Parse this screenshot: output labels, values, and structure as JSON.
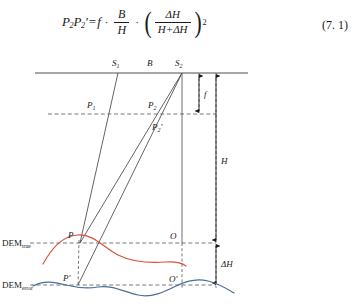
{
  "equation": {
    "lhs_p": "P",
    "lhs_sub1": "2",
    "lhs_p_prime": "P",
    "lhs_sub2": "2",
    "prime_mark": "′",
    "equals": "=",
    "f": "f",
    "dot": "·",
    "frac1_num": "B",
    "frac1_den": "H",
    "frac2_num": "ΔH",
    "frac2_den": "H+ΔH",
    "exponent": "2",
    "number": "(7. 1)",
    "full_text": "P2P2′ = f · B/H · (ΔH/(H+ΔH))²"
  },
  "diagram": {
    "labels": {
      "s1": "S",
      "s1_sub": "1",
      "baseline": "B",
      "s2": "S",
      "s2_sub": "2",
      "p1": "P",
      "p1_sub": "1",
      "p2": "P",
      "p2_sub": "2",
      "p2_prime": "P",
      "p2_prime_sub": "2",
      "prime": "′",
      "focal": "f",
      "height": "H",
      "delta_height": "ΔH",
      "o": "O",
      "o_prime": "O′",
      "p": "P",
      "p_prime": "P′",
      "dem_true": "DEM",
      "dem_true_sub": "true",
      "dem_error": "DEM",
      "dem_error_sub": "error"
    },
    "colors": {
      "dem_true_curve": "#d6543a",
      "dem_error_curve": "#4a6d96",
      "rays": "#3c3c3c",
      "dashed": "#555555",
      "sensor_line": "#888888",
      "text": "#1a1a1a"
    }
  }
}
